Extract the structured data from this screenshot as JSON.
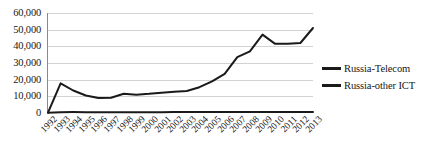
{
  "chart_data": {
    "type": "line",
    "title": "",
    "xlabel": "",
    "ylabel": "",
    "grid": true,
    "legend_position": "right",
    "ylim": [
      0,
      60000
    ],
    "ytick_labels": [
      "60,000",
      "50,000",
      "40,000",
      "30,000",
      "20,000",
      "10,000",
      "0"
    ],
    "ytick_values": [
      60000,
      50000,
      40000,
      30000,
      20000,
      10000,
      0
    ],
    "categories": [
      "1992",
      "1993",
      "1994",
      "1995",
      "1996",
      "1997",
      "1998",
      "1999",
      "2000",
      "2001",
      "2002",
      "2003",
      "2004",
      "2005",
      "2006",
      "2007",
      "2008",
      "2009",
      "2010",
      "2011",
      "2012",
      "2013"
    ],
    "series": [
      {
        "name": "Russia-Telecom",
        "color": "#1a1a1a",
        "values": [
          200,
          17800,
          13500,
          10500,
          9000,
          9200,
          11500,
          11000,
          11500,
          12200,
          12800,
          13200,
          15500,
          19000,
          23500,
          33500,
          37000,
          39500,
          47000,
          41500,
          41500,
          42000
        ]
      },
      {
        "name": "Russia-other ICT",
        "color": "#1a1a1a",
        "values": [
          200,
          500,
          550,
          500,
          480,
          480,
          500,
          500,
          520,
          520,
          540,
          540,
          560,
          560,
          580,
          580,
          600,
          600,
          620,
          620,
          640,
          640
        ]
      }
    ],
    "series_upper_tail": {
      "note_series": "Russia-Telecom",
      "values_tail": [
        47000,
        41500,
        41500,
        42000,
        51000
      ]
    }
  },
  "legend": {
    "items": [
      {
        "label": "Russia-Telecom"
      },
      {
        "label": "Russia-other ICT"
      }
    ]
  }
}
